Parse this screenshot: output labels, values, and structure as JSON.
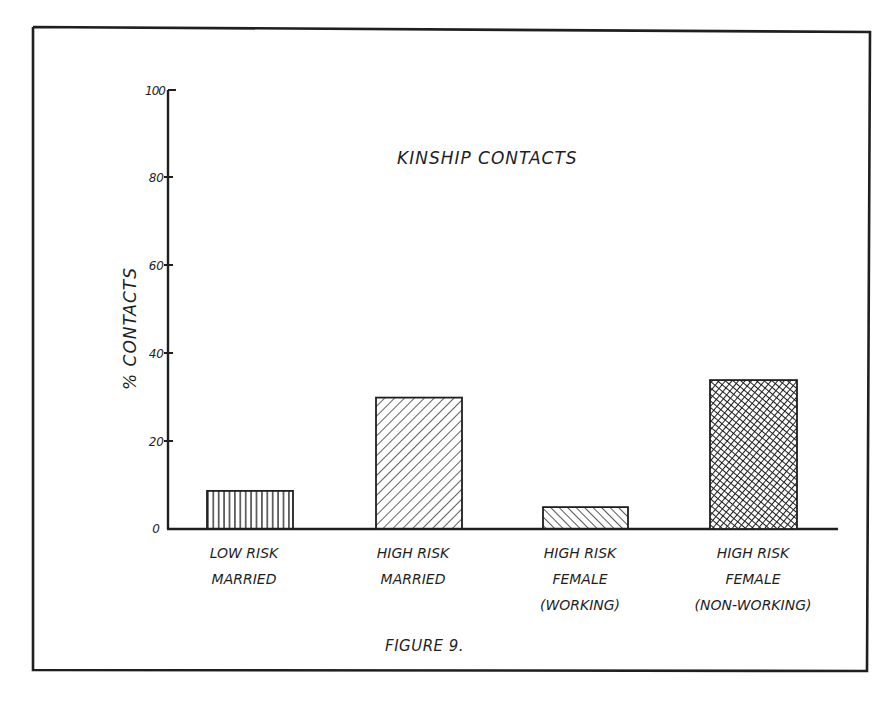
{
  "figure": {
    "title": "KINSHIP CONTACTS",
    "caption": "FIGURE 9.",
    "ylabel": "% CONTACTS"
  },
  "axis": {
    "y_ticks": [
      {
        "value": 0,
        "label": "0"
      },
      {
        "value": 20,
        "label": "20"
      },
      {
        "value": 40,
        "label": "40"
      },
      {
        "value": 60,
        "label": "60"
      },
      {
        "value": 80,
        "label": "80"
      },
      {
        "value": 100,
        "label": "100"
      }
    ]
  },
  "bars": [
    {
      "label_lines": [
        "LOW RISK",
        "MARRIED"
      ],
      "value": 8.7,
      "pattern": "vertical"
    },
    {
      "label_lines": [
        "HIGH RISK",
        "MARRIED"
      ],
      "value": 30,
      "pattern": "diagonal-forward"
    },
    {
      "label_lines": [
        "HIGH RISK",
        "FEMALE",
        "(WORKING)"
      ],
      "value": 5,
      "pattern": "diagonal-back"
    },
    {
      "label_lines": [
        "HIGH RISK",
        "FEMALE",
        "(NON-WORKING)"
      ],
      "value": 34,
      "pattern": "crosshatch"
    }
  ],
  "colors": {
    "ink": "#1f1f1f",
    "paper": "#ffffff"
  },
  "chart_data": {
    "type": "bar",
    "title": "KINSHIP CONTACTS",
    "categories": [
      "LOW RISK MARRIED",
      "HIGH RISK MARRIED",
      "HIGH RISK FEMALE (WORKING)",
      "HIGH RISK FEMALE (NON-WORKING)"
    ],
    "values": [
      8.7,
      30,
      5,
      34
    ],
    "xlabel": "",
    "ylabel": "% CONTACTS",
    "ylim": [
      0,
      100
    ],
    "yticks": [
      0,
      20,
      40,
      60,
      80,
      100
    ],
    "grid": false,
    "legend": null,
    "caption": "FIGURE 9."
  }
}
